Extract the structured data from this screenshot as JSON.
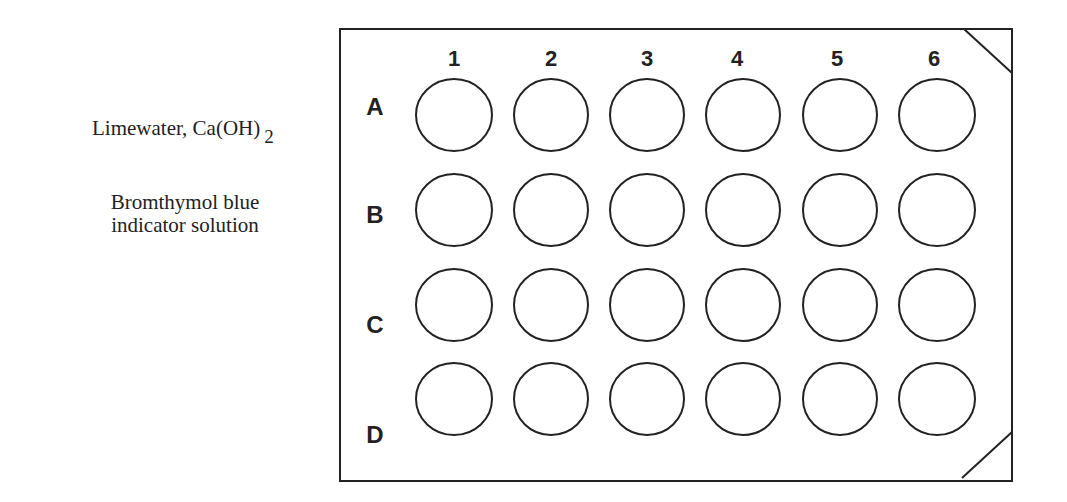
{
  "labels": {
    "limewater": "Limewater, Ca(OH)",
    "limewater_sub": "2",
    "bromthymol_line1": "Bromthymol blue",
    "bromthymol_line2": "indicator solution"
  },
  "plate": {
    "columns": [
      "1",
      "2",
      "3",
      "4",
      "5",
      "6"
    ],
    "rows": [
      "A",
      "B",
      "C",
      "D"
    ],
    "stroke_color": "#222222"
  }
}
